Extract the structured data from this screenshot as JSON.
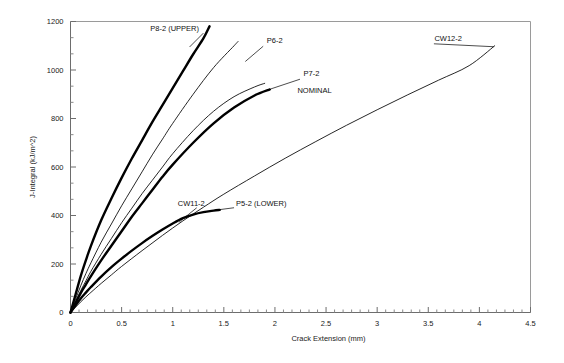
{
  "chart_data": {
    "type": "line",
    "title": "",
    "xlabel": "Crack Extension (mm)",
    "ylabel": "J-Integral (kJ/m^2)",
    "xlim": [
      0,
      4.5
    ],
    "ylim": [
      0,
      1200
    ],
    "xticks": [
      "0",
      "0.5",
      "1",
      "1.5",
      "2",
      "2.5",
      "3",
      "3.5",
      "4",
      "4.5"
    ],
    "xtick_values": [
      0,
      0.5,
      1,
      1.5,
      2,
      2.5,
      3,
      3.5,
      4,
      4.5
    ],
    "yticks": [
      "0",
      "200",
      "400",
      "600",
      "800",
      "1000",
      "1200"
    ],
    "ytick_values": [
      0,
      200,
      400,
      600,
      800,
      1000,
      1200
    ],
    "minor_tick_count_x": 5,
    "minor_tick_count_y": 2,
    "grid": "off",
    "legend_position": "inline-labels",
    "series": [
      {
        "name": "P8-2 (UPPER)",
        "style": "thick",
        "label_text": "P8-2 (UPPER)",
        "points": [
          [
            0,
            0
          ],
          [
            0.05,
            75
          ],
          [
            0.1,
            150
          ],
          [
            0.15,
            215
          ],
          [
            0.2,
            275
          ],
          [
            0.3,
            380
          ],
          [
            0.4,
            470
          ],
          [
            0.5,
            555
          ],
          [
            0.6,
            635
          ],
          [
            0.7,
            710
          ],
          [
            0.8,
            785
          ],
          [
            0.9,
            855
          ],
          [
            1.0,
            925
          ],
          [
            1.1,
            995
          ],
          [
            1.2,
            1065
          ],
          [
            1.3,
            1130
          ],
          [
            1.36,
            1180
          ]
        ]
      },
      {
        "name": "P6-2",
        "style": "thin",
        "label_text": "P6-2",
        "points": [
          [
            0,
            0
          ],
          [
            0.05,
            55
          ],
          [
            0.1,
            110
          ],
          [
            0.15,
            160
          ],
          [
            0.2,
            205
          ],
          [
            0.3,
            290
          ],
          [
            0.4,
            365
          ],
          [
            0.5,
            440
          ],
          [
            0.6,
            510
          ],
          [
            0.7,
            580
          ],
          [
            0.8,
            650
          ],
          [
            0.9,
            715
          ],
          [
            1.0,
            780
          ],
          [
            1.2,
            900
          ],
          [
            1.4,
            1010
          ],
          [
            1.6,
            1100
          ],
          [
            1.64,
            1118
          ]
        ]
      },
      {
        "name": "P7-2 NOMINAL",
        "style": "thick",
        "label_text": "P7-2",
        "secondary_label_text": "NOMINAL",
        "points": [
          [
            0,
            0
          ],
          [
            0.05,
            40
          ],
          [
            0.1,
            80
          ],
          [
            0.15,
            115
          ],
          [
            0.2,
            150
          ],
          [
            0.3,
            215
          ],
          [
            0.4,
            275
          ],
          [
            0.5,
            335
          ],
          [
            0.6,
            395
          ],
          [
            0.7,
            450
          ],
          [
            0.8,
            505
          ],
          [
            0.9,
            560
          ],
          [
            1.0,
            610
          ],
          [
            1.2,
            700
          ],
          [
            1.4,
            780
          ],
          [
            1.6,
            845
          ],
          [
            1.8,
            895
          ],
          [
            1.95,
            920
          ]
        ]
      },
      {
        "name": "CW11-2",
        "style": "thin",
        "label_text": "CW11-2",
        "points": [
          [
            0,
            0
          ],
          [
            0.05,
            45
          ],
          [
            0.1,
            90
          ],
          [
            0.15,
            130
          ],
          [
            0.2,
            170
          ],
          [
            0.3,
            240
          ],
          [
            0.4,
            305
          ],
          [
            0.5,
            370
          ],
          [
            0.6,
            430
          ],
          [
            0.7,
            490
          ],
          [
            0.8,
            545
          ],
          [
            0.9,
            600
          ],
          [
            1.0,
            655
          ],
          [
            1.2,
            750
          ],
          [
            1.4,
            830
          ],
          [
            1.6,
            890
          ],
          [
            1.8,
            930
          ],
          [
            1.9,
            945
          ]
        ]
      },
      {
        "name": "P5-2 (LOWER)",
        "style": "thick",
        "label_text": "P5-2 (LOWER)",
        "points": [
          [
            0,
            0
          ],
          [
            0.05,
            30
          ],
          [
            0.1,
            58
          ],
          [
            0.15,
            82
          ],
          [
            0.2,
            105
          ],
          [
            0.3,
            148
          ],
          [
            0.4,
            187
          ],
          [
            0.5,
            222
          ],
          [
            0.6,
            255
          ],
          [
            0.7,
            286
          ],
          [
            0.8,
            315
          ],
          [
            0.9,
            342
          ],
          [
            1.0,
            367
          ],
          [
            1.1,
            389
          ],
          [
            1.2,
            404
          ],
          [
            1.3,
            414
          ],
          [
            1.4,
            420
          ],
          [
            1.46,
            423
          ]
        ]
      },
      {
        "name": "CW12-2",
        "style": "thin",
        "label_text": "CW12-2",
        "points": [
          [
            0,
            0
          ],
          [
            0.05,
            22
          ],
          [
            0.1,
            44
          ],
          [
            0.15,
            64
          ],
          [
            0.2,
            83
          ],
          [
            0.3,
            120
          ],
          [
            0.4,
            155
          ],
          [
            0.5,
            190
          ],
          [
            0.7,
            255
          ],
          [
            0.9,
            318
          ],
          [
            1.1,
            378
          ],
          [
            1.3,
            434
          ],
          [
            1.5,
            488
          ],
          [
            1.8,
            563
          ],
          [
            2.1,
            636
          ],
          [
            2.4,
            705
          ],
          [
            2.7,
            772
          ],
          [
            3.0,
            836
          ],
          [
            3.3,
            898
          ],
          [
            3.6,
            958
          ],
          [
            3.9,
            1018
          ],
          [
            4.15,
            1100
          ]
        ]
      }
    ],
    "annotations": [
      {
        "text": "P8-2 (UPPER)",
        "x": 0.78,
        "y": 1162
      },
      {
        "text": "P6-2",
        "x": 1.92,
        "y": 1110
      },
      {
        "text": "P7-2",
        "x": 2.28,
        "y": 975
      },
      {
        "text": "NOMINAL",
        "x": 2.22,
        "y": 905
      },
      {
        "text": "CW11-2",
        "x": 1.05,
        "y": 438
      },
      {
        "text": "P5-2 (LOWER)",
        "x": 1.62,
        "y": 438
      },
      {
        "text": "CW12-2",
        "x": 3.56,
        "y": 1120
      }
    ]
  }
}
